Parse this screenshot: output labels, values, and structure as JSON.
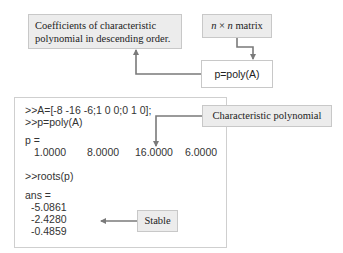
{
  "callouts": {
    "coefficients": {
      "line1": "Coefficients of characteristic",
      "line2": "polynomial in descending order."
    },
    "matrix": {
      "n1": "n",
      "times": " × ",
      "n2": "n",
      "suffix": " matrix"
    },
    "poly_call": "p=poly(A)",
    "char_poly": "Characteristic polynomial",
    "stable": "Stable"
  },
  "console": {
    "lines": {
      "cmd1": ">>A=[-8 -16 -6;1 0 0;0 1 0];",
      "cmd2": ">>p=poly(A)",
      "p_label": "p =",
      "cmd3": ">>roots(p)",
      "ans_label": "ans ="
    },
    "p_values": [
      "1.0000",
      "8.0000",
      "16.0000",
      "6.0000"
    ],
    "roots": [
      "-5.0861",
      "-2.4280",
      "-0.4859"
    ]
  },
  "colors": {
    "callout_fill": "#ececec",
    "border": "#c8c8c8",
    "arrow": "#7a7a7a"
  }
}
